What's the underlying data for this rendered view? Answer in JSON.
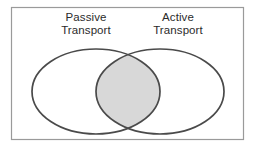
{
  "diagram": {
    "type": "venn-diagram",
    "title": "",
    "frame": {
      "border_color": "#9a9a9a",
      "background_color": "#ffffff"
    },
    "sets": [
      {
        "id": "passive",
        "label_line1": "Passive",
        "label_line2": "Transport",
        "fill_color": "#ffffff",
        "stroke_color": "#4a4a4a"
      },
      {
        "id": "active",
        "label_line1": "Active",
        "label_line2": "Transport",
        "fill_color": "#ffffff",
        "stroke_color": "#4a4a4a"
      }
    ],
    "intersection": {
      "label": "",
      "fill_color": "#d8d8d8",
      "stroke_color": "#4a4a4a"
    },
    "colors": {
      "stroke": "#4a4a4a",
      "frame": "#9a9a9a",
      "intersection_fill": "#d8d8d8",
      "text": "#2b2b2b",
      "background": "#ffffff"
    }
  }
}
